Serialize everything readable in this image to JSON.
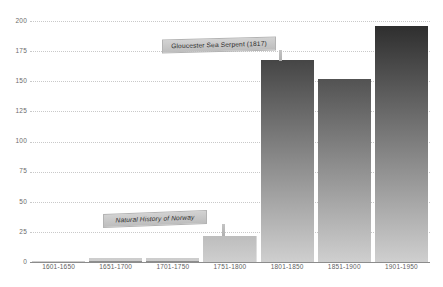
{
  "chart_data": {
    "type": "bar",
    "title": "",
    "xlabel": "",
    "ylabel": "",
    "categories": [
      "1601-1650",
      "1651-1700",
      "1701-1750",
      "1751-1800",
      "1801-1850",
      "1851-1900",
      "1901-1950"
    ],
    "values": [
      0.5,
      3,
      3,
      22,
      168,
      152,
      196
    ],
    "ylim": [
      0,
      200
    ],
    "yticks": [
      0,
      25,
      50,
      75,
      100,
      125,
      150,
      175,
      200
    ],
    "ytick_labels": [
      "0",
      "25",
      "50",
      "75",
      "100",
      "125",
      "150",
      "175",
      "200"
    ],
    "grid": true,
    "legend": false,
    "bar_gradient_top": "#2b2b2b",
    "bar_gradient_bottom": "#cfcfcf",
    "gridline_color": "#c9c9c9",
    "baseline_color": "#8c8c8c",
    "background": "#ffffff",
    "annotations": [
      {
        "label": "Gloucester Sea Serpent (1817)",
        "target_category": "1801-1850",
        "style": "normal"
      },
      {
        "label": "Natural History of Norway",
        "target_category": "1751-1800",
        "style": "italic"
      }
    ]
  }
}
